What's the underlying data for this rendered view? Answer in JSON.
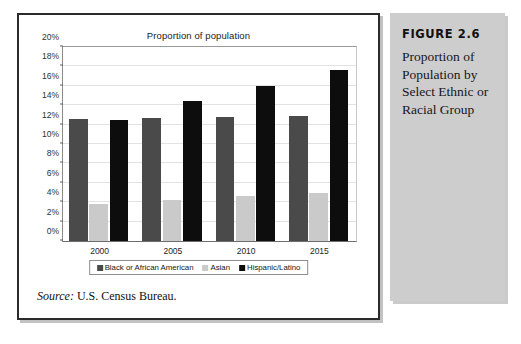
{
  "figure": {
    "caption_title": "FIGURE 2.6",
    "caption_body": "Proportion of Population by Select Ethnic or Racial Group",
    "source_label": "Source:",
    "source_text": " U.S. Census Bureau."
  },
  "chart_data": {
    "type": "bar",
    "title": "Proportion of population",
    "xlabel": "",
    "ylabel": "",
    "categories": [
      "2000",
      "2005",
      "2010",
      "2015"
    ],
    "series": [
      {
        "name": "Black or African American",
        "color": "#4a4a4a",
        "values": [
          12.6,
          12.7,
          12.8,
          12.9
        ]
      },
      {
        "name": "Asian",
        "color": "#cacaca",
        "values": [
          3.8,
          4.2,
          4.6,
          5.0
        ]
      },
      {
        "name": "Hispanic/Latino",
        "color": "#0d0d0d",
        "values": [
          12.5,
          14.4,
          16.0,
          17.6
        ]
      }
    ],
    "ylim": [
      0,
      20
    ],
    "ytick_step": 2,
    "ytick_labels": [
      "0%",
      "2%",
      "4%",
      "6%",
      "8%",
      "10%",
      "12%",
      "14%",
      "16%",
      "18%",
      "20%"
    ],
    "value_suffix": "%",
    "grid": true,
    "legend_position": "bottom"
  }
}
